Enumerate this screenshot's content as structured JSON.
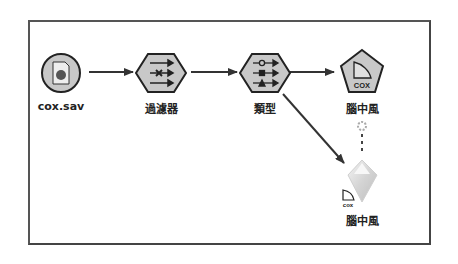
{
  "stream": {
    "nodes": [
      {
        "id": "source",
        "label": "cox.sav",
        "shape": "circle",
        "icon": "spss-file-icon"
      },
      {
        "id": "filter",
        "label": "過濾器",
        "shape": "hexagon",
        "icon": "filter-icon"
      },
      {
        "id": "type",
        "label": "類型",
        "shape": "hexagon",
        "icon": "type-icon"
      },
      {
        "id": "cox_model",
        "label": "腦中風",
        "shape": "pentagon",
        "icon": "cox-model-icon",
        "icon_text": "COX"
      },
      {
        "id": "cox_nugget",
        "label": "腦中風",
        "shape": "diamond",
        "icon": "model-nugget-icon",
        "icon_text": "cox"
      }
    ],
    "links": [
      {
        "from": "source",
        "to": "filter"
      },
      {
        "from": "filter",
        "to": "type"
      },
      {
        "from": "type",
        "to": "cox_model"
      },
      {
        "from": "type",
        "to": "cox_nugget"
      },
      {
        "from": "cox_model",
        "to": "cox_nugget",
        "style": "dashed"
      }
    ]
  },
  "colors": {
    "node_fill": "#c8c8c8",
    "node_stroke": "#222222",
    "link": "#333333",
    "frame": "#555555"
  }
}
